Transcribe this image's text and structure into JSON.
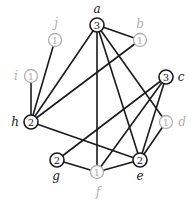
{
  "diagram": {
    "type": "graph",
    "nodes": [
      {
        "id": "a",
        "label": "a",
        "value": "3",
        "style": "dark"
      },
      {
        "id": "b",
        "label": "b",
        "value": "1",
        "style": "light"
      },
      {
        "id": "c",
        "label": "c",
        "value": "3",
        "style": "dark"
      },
      {
        "id": "d",
        "label": "d",
        "value": "1",
        "style": "light"
      },
      {
        "id": "e",
        "label": "e",
        "value": "2",
        "style": "dark"
      },
      {
        "id": "f",
        "label": "f",
        "value": "1",
        "style": "light"
      },
      {
        "id": "g",
        "label": "g",
        "value": "2",
        "style": "dark"
      },
      {
        "id": "h",
        "label": "h",
        "value": "2",
        "style": "dark"
      },
      {
        "id": "i",
        "label": "i",
        "value": "1",
        "style": "light"
      },
      {
        "id": "j",
        "label": "j",
        "value": "1",
        "style": "light"
      }
    ],
    "edges": [
      [
        "a",
        "b"
      ],
      [
        "a",
        "h"
      ],
      [
        "a",
        "f"
      ],
      [
        "a",
        "e"
      ],
      [
        "a",
        "d"
      ],
      [
        "b",
        "h"
      ],
      [
        "c",
        "g"
      ],
      [
        "c",
        "f"
      ],
      [
        "c",
        "e"
      ],
      [
        "d",
        "e"
      ],
      [
        "e",
        "h"
      ],
      [
        "e",
        "f"
      ],
      [
        "f",
        "g"
      ],
      [
        "h",
        "i"
      ],
      [
        "h",
        "j"
      ]
    ],
    "colors": {
      "dark": "#1a1a1a",
      "light": "#b0b0b0"
    }
  }
}
